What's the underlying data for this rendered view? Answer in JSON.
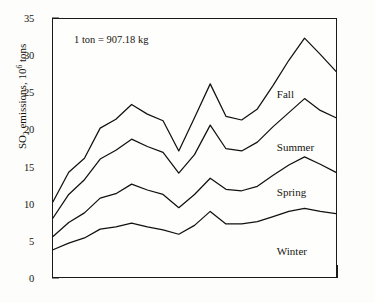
{
  "chart_data": {
    "type": "line",
    "title": "",
    "xlabel": "",
    "ylabel": "SO2 emissions, 10^6 tons",
    "ylabel_parts": {
      "pre": "SO",
      "sub": "2",
      "mid": " emissions, 10",
      "sup": "6",
      "post": " tons"
    },
    "ylim": [
      0,
      35
    ],
    "ytick_values": [
      0,
      5,
      10,
      15,
      20,
      25,
      30,
      35
    ],
    "ytick_labels": [
      "0",
      "5",
      "10",
      "15",
      "20",
      "25",
      "30",
      "35"
    ],
    "xlim": [
      0,
      18
    ],
    "xtick_values": [
      0,
      1,
      2,
      3,
      4,
      5,
      6,
      7,
      8,
      9,
      10,
      11,
      12,
      13,
      14,
      15,
      16,
      17,
      18
    ],
    "xtick_labels": [
      "",
      "",
      "",
      "",
      "",
      "",
      "",
      "",
      "",
      "",
      "",
      "",
      "",
      "",
      "",
      "",
      "",
      "",
      ""
    ],
    "grid": false,
    "legend_position": "inline-right",
    "annotations": [
      {
        "text": "1 ton = 907.18 kg",
        "x": 1.4,
        "y": 33.0
      }
    ],
    "x": [
      0,
      1,
      2,
      3,
      4,
      5,
      6,
      7,
      8,
      9,
      10,
      11,
      12,
      13,
      14,
      15,
      16,
      17,
      18
    ],
    "series": [
      {
        "name": "Fall",
        "label_x": 14.2,
        "label_y": 25.6,
        "values": [
          10.2,
          14.2,
          16.1,
          20.2,
          21.4,
          23.4,
          22.1,
          21.2,
          17.1,
          21.6,
          26.2,
          21.8,
          21.3,
          22.8,
          26.0,
          29.4,
          32.4,
          30.2,
          27.9
        ]
      },
      {
        "name": "Summer",
        "label_x": 14.2,
        "label_y": 18.4,
        "values": [
          8.0,
          11.2,
          13.2,
          16.0,
          17.2,
          18.7,
          17.7,
          16.9,
          14.1,
          16.6,
          20.6,
          17.4,
          17.1,
          18.3,
          20.4,
          22.3,
          24.2,
          22.6,
          21.6
        ]
      },
      {
        "name": "Spring",
        "label_x": 14.2,
        "label_y": 12.4,
        "values": [
          5.5,
          7.4,
          8.7,
          10.7,
          11.3,
          12.6,
          11.8,
          11.2,
          9.4,
          11.2,
          13.4,
          11.9,
          11.7,
          12.3,
          13.8,
          15.2,
          16.3,
          15.3,
          14.2
        ]
      },
      {
        "name": "Winter",
        "label_x": 14.2,
        "label_y": 4.4,
        "values": [
          3.7,
          4.6,
          5.3,
          6.5,
          6.8,
          7.3,
          6.8,
          6.4,
          5.8,
          7.0,
          8.9,
          7.2,
          7.2,
          7.5,
          8.2,
          8.9,
          9.3,
          8.9,
          8.6
        ]
      }
    ]
  }
}
